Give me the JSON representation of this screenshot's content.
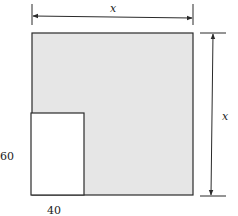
{
  "diagram": {
    "type": "geometry-figure",
    "labels": {
      "top_dimension": "x",
      "right_dimension": "x",
      "cutout_height": "60",
      "cutout_width": "40"
    },
    "colors": {
      "shaded_region": "#e6e6e6",
      "cutout": "#ffffff",
      "stroke": "#2a2a2a"
    }
  }
}
